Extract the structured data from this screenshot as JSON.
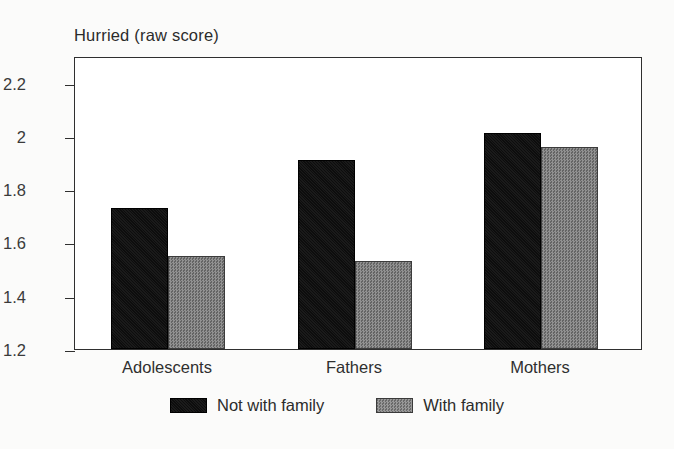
{
  "chart_data": {
    "type": "bar",
    "title": "Hurried (raw score)",
    "xlabel": "",
    "ylabel": "",
    "categories": [
      "Adolescents",
      "Fathers",
      "Mothers"
    ],
    "series": [
      {
        "name": "Not with family",
        "color": "#0d0d0d",
        "values": [
          1.73,
          1.91,
          2.01
        ]
      },
      {
        "name": "With family",
        "color": "#757575",
        "values": [
          1.55,
          1.53,
          1.96
        ]
      }
    ],
    "ylim": [
      1.2,
      2.3
    ],
    "yticks": [
      1.2,
      1.4,
      1.6,
      1.8,
      2.0,
      2.2
    ],
    "ytick_labels": [
      "1.2",
      "1.4",
      "1.6",
      "1.8",
      "2",
      "2.2"
    ],
    "grid": false,
    "legend_position": "bottom-center"
  },
  "legend": {
    "items": [
      {
        "label": "Not with family",
        "swatch": "black-square-swatch"
      },
      {
        "label": "With family",
        "swatch": "gray-square-swatch"
      }
    ]
  }
}
